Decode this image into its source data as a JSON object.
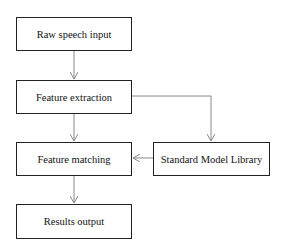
{
  "diagram": {
    "nodes": [
      {
        "id": "raw",
        "label": "Raw speech input"
      },
      {
        "id": "extract",
        "label": "Feature extraction"
      },
      {
        "id": "match",
        "label": "Feature matching"
      },
      {
        "id": "library",
        "label": "Standard Model Library"
      },
      {
        "id": "output",
        "label": "Results output"
      }
    ],
    "edges": [
      {
        "from": "raw",
        "to": "extract"
      },
      {
        "from": "extract",
        "to": "match"
      },
      {
        "from": "extract",
        "to": "library"
      },
      {
        "from": "library",
        "to": "match"
      },
      {
        "from": "match",
        "to": "output"
      }
    ],
    "colors": {
      "line": "#888888",
      "border": "#222222",
      "background": "#ffffff"
    }
  }
}
